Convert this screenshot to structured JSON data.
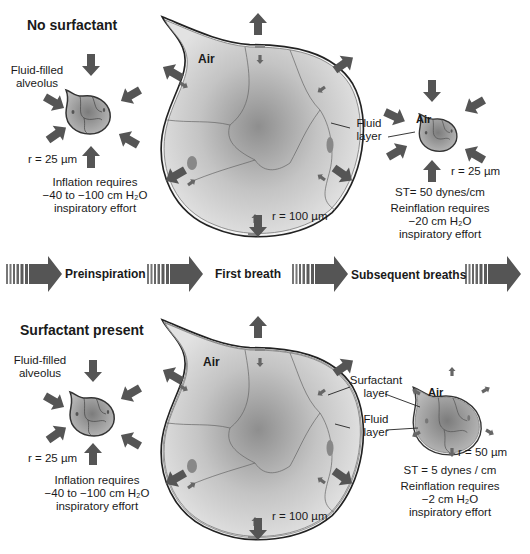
{
  "panels": {
    "top": {
      "title": "No surfactant",
      "small_alveolus": {
        "label_line1": "Fluid-filled",
        "label_line2": "alveolus",
        "radius": "r = 25 µm",
        "req_line1": "Inflation requires",
        "req_line2": "−40 to −100 cm H₂O",
        "req_line3": "inspiratory effort"
      },
      "large_alveolus": {
        "air": "Air",
        "radius": "r = 100 µm",
        "fluid_layer_line1": "Fluid",
        "fluid_layer_line2": "layer"
      },
      "collapsed_alveolus": {
        "air": "Air",
        "radius": "r = 25 µm",
        "st": "ST= 50 dynes/cm",
        "req_line1": "Reinflation requires",
        "req_line2": "−20 cm H₂O",
        "req_line3": "inspiratory effort"
      }
    },
    "bottom": {
      "title": "Surfactant present",
      "small_alveolus": {
        "label_line1": "Fluid-filled",
        "label_line2": "alveolus",
        "radius": "r = 25 µm",
        "req_line1": "Inflation requires",
        "req_line2": "−40 to −100 cm H₂O",
        "req_line3": "inspiratory effort"
      },
      "large_alveolus": {
        "air": "Air",
        "radius": "r = 100 µm"
      },
      "stable_alveolus": {
        "air": "Air",
        "radius": "r = 50   µm",
        "surfactant_layer_line1": "Surfactant",
        "surfactant_layer_line2": "layer",
        "fluid_layer_line1": "Fluid",
        "fluid_layer_line2": "layer",
        "st": "ST = 5 dynes / cm",
        "req_line1": "Reinflation requires",
        "req_line2": "−2 cm H₂O",
        "req_line3": "inspiratory effort"
      }
    }
  },
  "timeline": {
    "stages": [
      "Preinspiration",
      "First breath",
      "Subsequent breaths"
    ]
  },
  "colors": {
    "arrow": "#555555",
    "alveolus_fill": "#c8c8c8",
    "alveolus_center": "#8a8a8a",
    "outline": "#333333"
  }
}
